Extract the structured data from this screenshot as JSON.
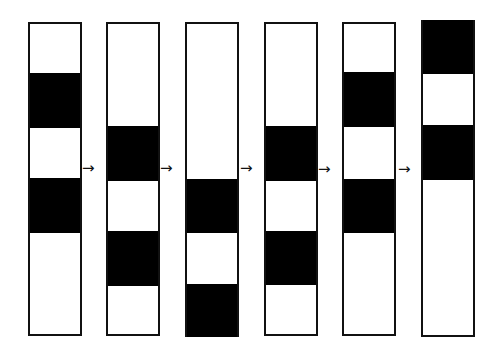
{
  "diagram": {
    "colors": {
      "band": "#000000",
      "background": "#ffffff",
      "border": "#111111"
    },
    "arrow_glyph": "→",
    "columns": [
      {
        "x": 28,
        "top": 22,
        "bottom": 336,
        "width": 54,
        "bands": [
          [
            73,
            128
          ],
          [
            178,
            233
          ]
        ]
      },
      {
        "x": 106,
        "top": 22,
        "bottom": 336,
        "width": 54,
        "bands": [
          [
            126,
            181
          ],
          [
            231,
            286
          ]
        ]
      },
      {
        "x": 185,
        "top": 22,
        "bottom": 337,
        "width": 54,
        "bands": [
          [
            179,
            233
          ],
          [
            284,
            337
          ]
        ]
      },
      {
        "x": 264,
        "top": 22,
        "bottom": 336,
        "width": 54,
        "bands": [
          [
            126,
            181
          ],
          [
            231,
            285
          ]
        ]
      },
      {
        "x": 342,
        "top": 22,
        "bottom": 336,
        "width": 54,
        "bands": [
          [
            72,
            127
          ],
          [
            179,
            233
          ]
        ]
      },
      {
        "x": 421,
        "top": 20,
        "bottom": 337,
        "width": 54,
        "bands": [
          [
            20,
            74
          ],
          [
            125,
            180
          ]
        ]
      }
    ],
    "arrows": [
      {
        "x": 82,
        "y": 161
      },
      {
        "x": 160,
        "y": 161
      },
      {
        "x": 240,
        "y": 161
      },
      {
        "x": 318,
        "y": 162
      },
      {
        "x": 398,
        "y": 162
      }
    ]
  }
}
